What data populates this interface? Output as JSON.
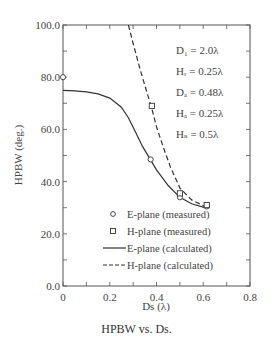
{
  "chart_data": {
    "type": "line",
    "title": "",
    "caption": "HPBW vs. Ds.",
    "xlabel": "Ds (λ)",
    "ylabel": "HPBW (deg.)",
    "xlim": [
      0,
      0.8
    ],
    "ylim": [
      0,
      100
    ],
    "xticks": [
      "0",
      "0.2",
      "0.4",
      "0.6",
      "0.8"
    ],
    "yticks": [
      "0.0",
      "20.0",
      "40.0",
      "60.0",
      "80.0",
      "100.0"
    ],
    "grid": false,
    "legend_position": "lower right",
    "annotations": [
      "D₁ = 2.0λ",
      "Hᵣ = 0.25λ",
      "Dₐ = 0.48λ",
      "Hₐ = 0.25λ",
      "Hₛ = 0.5λ"
    ],
    "series": [
      {
        "name": "E-plane (measured)",
        "marker": "circle",
        "x": [
          0,
          0.375,
          0.5,
          0.615
        ],
        "y": [
          80.0,
          48.5,
          34.0,
          30.5
        ]
      },
      {
        "name": "H-plane (measured)",
        "marker": "square",
        "x": [
          0.38,
          0.5,
          0.615
        ],
        "y": [
          69.0,
          35.5,
          31.0
        ]
      },
      {
        "name": "E-plane (calculated)",
        "style": "solid",
        "x": [
          0,
          0.05,
          0.1,
          0.15,
          0.2,
          0.25,
          0.28,
          0.31,
          0.34,
          0.37,
          0.4,
          0.45,
          0.5,
          0.55,
          0.6,
          0.615
        ],
        "y": [
          75,
          74.8,
          74.4,
          73.6,
          72.0,
          68.5,
          64.5,
          59.0,
          53.5,
          49.0,
          44.5,
          38.5,
          34.0,
          31.5,
          30.2,
          30.0
        ]
      },
      {
        "name": "H-plane (calculated)",
        "style": "dashed",
        "x": [
          0.28,
          0.3,
          0.33,
          0.36,
          0.38,
          0.4,
          0.43,
          0.46,
          0.5,
          0.55,
          0.6,
          0.615
        ],
        "y": [
          100,
          93,
          83,
          74,
          68,
          61,
          53,
          45.5,
          37.5,
          33.0,
          30.8,
          30.5
        ]
      }
    ]
  }
}
